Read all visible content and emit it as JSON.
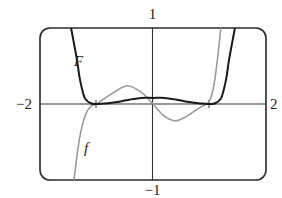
{
  "chart_data": {
    "type": "line",
    "title": "",
    "xlabel": "",
    "ylabel": "",
    "xlim": [
      -2,
      2
    ],
    "ylim": [
      -1,
      1
    ],
    "grid": false,
    "tick_labels": {
      "x_left": "−2",
      "x_right": "2",
      "y_top": "1",
      "y_bottom": "−1"
    },
    "x_ticks_marked": [
      -1,
      1
    ],
    "series": [
      {
        "name": "F",
        "label": "F",
        "color": "#1a1a1a",
        "description": "antiderivative curve: near zero flat, small local max at x=0, steep rise near |x|>1.2",
        "x": [
          -1.45,
          -1.35,
          -1.3,
          -1.25,
          -1.2,
          -1.1,
          -1.0,
          -0.8,
          -0.6,
          -0.4,
          -0.2,
          0.0,
          0.2,
          0.4,
          0.6,
          0.8,
          1.0,
          1.1,
          1.2,
          1.25,
          1.3,
          1.35,
          1.45
        ],
        "y": [
          1.0,
          0.6,
          0.35,
          0.18,
          0.07,
          0.01,
          0.0,
          0.01,
          0.03,
          0.06,
          0.08,
          0.08,
          0.08,
          0.06,
          0.03,
          0.01,
          0.0,
          0.01,
          0.07,
          0.18,
          0.35,
          0.6,
          1.0
        ]
      },
      {
        "name": "f",
        "label": "f",
        "color": "#999999",
        "description": "derivative curve: steep from bottom near x=-1.4, local max ~x=-0.45, zero near x=0, local min ~x=0.4, steep rise near x=1.15",
        "x": [
          -1.4,
          -1.3,
          -1.2,
          -1.1,
          -1.0,
          -0.9,
          -0.7,
          -0.45,
          -0.2,
          0.0,
          0.2,
          0.4,
          0.6,
          0.8,
          0.95,
          1.0,
          1.05,
          1.1,
          1.15,
          1.2
        ],
        "y": [
          -1.0,
          -0.45,
          -0.15,
          -0.03,
          0.0,
          0.05,
          0.15,
          0.24,
          0.15,
          0.0,
          -0.16,
          -0.22,
          -0.16,
          -0.06,
          0.0,
          0.04,
          0.15,
          0.35,
          0.65,
          1.0
        ]
      }
    ],
    "annotations": [
      {
        "text": "F",
        "x": -1.3,
        "y": 0.58
      },
      {
        "text": "f",
        "x": -1.15,
        "y": -0.58
      }
    ]
  },
  "labels": {
    "y_top": "1",
    "y_bottom": "−1",
    "x_left": "−2",
    "x_right": "2",
    "F": "F",
    "f": "f"
  }
}
